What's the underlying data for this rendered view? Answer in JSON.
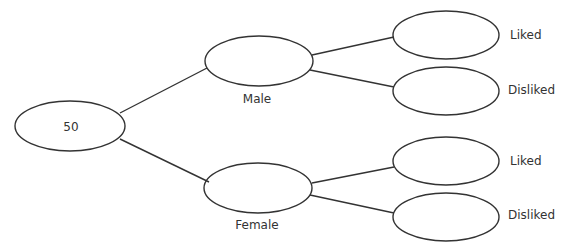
{
  "diagram": {
    "type": "tree",
    "root": {
      "label": "50"
    },
    "branches": [
      {
        "label": "Male",
        "children": [
          {
            "label": "Liked"
          },
          {
            "label": "Disliked"
          }
        ]
      },
      {
        "label": "Female",
        "children": [
          {
            "label": "Liked"
          },
          {
            "label": "Disliked"
          }
        ]
      }
    ],
    "stroke_color": "#333333"
  }
}
